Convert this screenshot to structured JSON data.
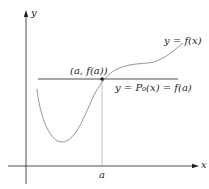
{
  "diagram": {
    "axes": {
      "x_label": "x",
      "y_label": "y"
    },
    "curve_label": "y = f(x)",
    "point_label": "(a, f(a))",
    "horizontal_line_label": "y = P₀(x) = f(a)",
    "x_tick_label": "a",
    "colors": {
      "axis": "#231f20",
      "curve": "#8a8a8a",
      "horizontal_line": "#231f20",
      "guide_line": "#9a9a9a",
      "point": "#231f20"
    }
  }
}
